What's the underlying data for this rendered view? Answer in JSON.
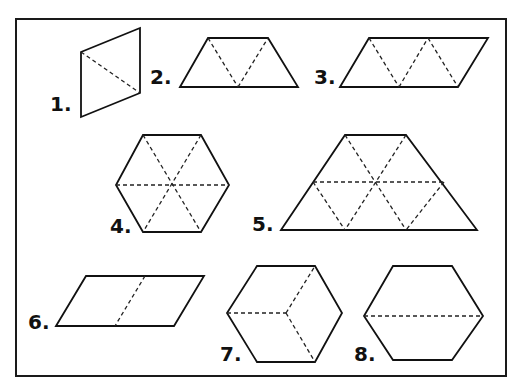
{
  "diagram": {
    "colors": {
      "stroke": "#111111",
      "dash": "#222222",
      "background": "#ffffff"
    },
    "frame": {
      "x": 16,
      "y": 19,
      "width": 490,
      "height": 357
    },
    "figures": [
      {
        "label": "1.",
        "shape": "rhombus (2 triangles)",
        "label_pos": [
          50,
          111
        ],
        "outline": [
          [
            81,
            52
          ],
          [
            140,
            28
          ],
          [
            140,
            93
          ],
          [
            81,
            117
          ]
        ],
        "dashed": [
          [
            [
              81,
              52
            ],
            [
              140,
              93
            ]
          ]
        ]
      },
      {
        "label": "2.",
        "shape": "trapezoid (3 triangles)",
        "label_pos": [
          150,
          84
        ],
        "outline": [
          [
            180,
            87
          ],
          [
            208,
            38
          ],
          [
            268,
            38
          ],
          [
            298,
            87
          ]
        ],
        "dashed": [
          [
            [
              208,
              38
            ],
            [
              238,
              87
            ]
          ],
          [
            [
              238,
              87
            ],
            [
              268,
              38
            ]
          ]
        ]
      },
      {
        "label": "3.",
        "shape": "parallelogram (4 triangles)",
        "label_pos": [
          314,
          84
        ],
        "outline": [
          [
            340,
            87
          ],
          [
            369,
            38
          ],
          [
            488,
            38
          ],
          [
            458,
            87
          ]
        ],
        "dashed": [
          [
            [
              369,
              38
            ],
            [
              399,
              87
            ]
          ],
          [
            [
              399,
              87
            ],
            [
              428,
              38
            ]
          ],
          [
            [
              428,
              38
            ],
            [
              458,
              87
            ]
          ]
        ]
      },
      {
        "label": "4.",
        "shape": "hexagon (6 triangles)",
        "label_pos": [
          110,
          233
        ],
        "outline": [
          [
            143,
            135
          ],
          [
            201,
            135
          ],
          [
            229,
            185
          ],
          [
            201,
            232
          ],
          [
            143,
            232
          ],
          [
            116,
            185
          ]
        ],
        "dashed": [
          [
            [
              116,
              185
            ],
            [
              229,
              185
            ]
          ],
          [
            [
              143,
              135
            ],
            [
              201,
              232
            ]
          ],
          [
            [
              201,
              135
            ],
            [
              143,
              232
            ]
          ]
        ]
      },
      {
        "label": "5.",
        "shape": "large trapezoid (9 triangles)",
        "label_pos": [
          252,
          231
        ],
        "outline": [
          [
            281,
            230
          ],
          [
            345,
            135
          ],
          [
            406,
            135
          ],
          [
            477,
            230
          ]
        ],
        "dashed": [
          [
            [
              313,
              182
            ],
            [
              444,
              182
            ]
          ],
          [
            [
              345,
              135
            ],
            [
              406,
              230
            ]
          ],
          [
            [
              406,
              135
            ],
            [
              345,
              230
            ]
          ],
          [
            [
              313,
              182
            ],
            [
              345,
              230
            ]
          ],
          [
            [
              444,
              182
            ],
            [
              406,
              230
            ]
          ]
        ]
      },
      {
        "label": "6.",
        "shape": "parallelogram (2 rhombi)",
        "label_pos": [
          28,
          329
        ],
        "outline": [
          [
            56,
            326
          ],
          [
            86,
            276
          ],
          [
            204,
            276
          ],
          [
            174,
            326
          ]
        ],
        "dashed": [
          [
            [
              145,
              276
            ],
            [
              115,
              326
            ]
          ]
        ]
      },
      {
        "label": "7.",
        "shape": "hexagon (3 rhombi, cube view)",
        "label_pos": [
          220,
          361
        ],
        "outline": [
          [
            257,
            266
          ],
          [
            315,
            266
          ],
          [
            342,
            313
          ],
          [
            315,
            362
          ],
          [
            257,
            362
          ],
          [
            227,
            313
          ]
        ],
        "dashed": [
          [
            [
              227,
              313
            ],
            [
              286,
              313
            ]
          ],
          [
            [
              286,
              313
            ],
            [
              315,
              266
            ]
          ],
          [
            [
              286,
              313
            ],
            [
              315,
              362
            ]
          ]
        ]
      },
      {
        "label": "8.",
        "shape": "hexagon (2 trapezoids)",
        "label_pos": [
          354,
          361
        ],
        "outline": [
          [
            393,
            266
          ],
          [
            452,
            266
          ],
          [
            483,
            316
          ],
          [
            452,
            360
          ],
          [
            393,
            360
          ],
          [
            364,
            316
          ]
        ],
        "dashed": [
          [
            [
              364,
              316
            ],
            [
              483,
              316
            ]
          ]
        ]
      }
    ]
  }
}
